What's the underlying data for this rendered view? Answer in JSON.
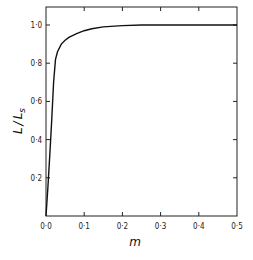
{
  "chart_data": {
    "type": "line",
    "title": "",
    "xlabel": "m",
    "ylabel": "L / Ls",
    "xlim": [
      0,
      0.5
    ],
    "ylim": [
      0,
      1.1
    ],
    "grid": false,
    "legend": null,
    "x_ticks": [
      "0·0",
      "0·1",
      "0·2",
      "0·3",
      "0·4",
      "0·5"
    ],
    "y_ticks": [
      "0·2",
      "0·4",
      "0·6",
      "0·8",
      "1·0"
    ],
    "series": [
      {
        "name": "L/Ls",
        "x": [
          0.0,
          0.005,
          0.01,
          0.015,
          0.02,
          0.025,
          0.03,
          0.04,
          0.05,
          0.06,
          0.08,
          0.1,
          0.12,
          0.15,
          0.2,
          0.25,
          0.3,
          0.4,
          0.5
        ],
        "y": [
          0.0,
          0.15,
          0.32,
          0.5,
          0.7,
          0.82,
          0.86,
          0.9,
          0.92,
          0.935,
          0.955,
          0.97,
          0.98,
          0.99,
          0.997,
          1.0,
          1.0,
          1.0,
          1.0
        ]
      }
    ]
  },
  "labels": {
    "xlabel": "m",
    "ylabel_L": "L",
    "ylabel_slash": "/",
    "ylabel_Ls": "L",
    "ylabel_s": "s",
    "x_ticks": [
      "0·0",
      "0·1",
      "0·2",
      "0·3",
      "0·4",
      "0·5"
    ],
    "y_ticks": [
      "0·2",
      "0·4",
      "0·6",
      "0·8",
      "1·0"
    ]
  }
}
